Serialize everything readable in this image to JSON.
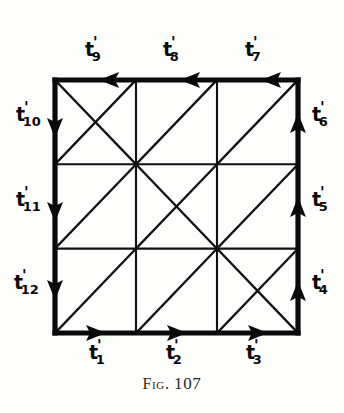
{
  "figure": {
    "caption_prefix": "Fig.",
    "caption_number": "107",
    "caption_full": "FIG. 107",
    "ink_color": "#0a0a0a",
    "background_color": "#fdfdfb"
  },
  "diagram": {
    "type": "truss-grid",
    "grid": {
      "rows": 3,
      "cols": 3
    },
    "frame": {
      "x": 55,
      "y": 80,
      "width": 243,
      "height": 253
    },
    "cell_diagonals": [
      {
        "row": 0,
        "col": 0,
        "main": true,
        "anti": true
      },
      {
        "row": 0,
        "col": 1,
        "main": false,
        "anti": true
      },
      {
        "row": 0,
        "col": 2,
        "main": false,
        "anti": true
      },
      {
        "row": 1,
        "col": 0,
        "main": false,
        "anti": true
      },
      {
        "row": 1,
        "col": 1,
        "main": true,
        "anti": true
      },
      {
        "row": 1,
        "col": 2,
        "main": false,
        "anti": true
      },
      {
        "row": 2,
        "col": 0,
        "main": false,
        "anti": true
      },
      {
        "row": 2,
        "col": 1,
        "main": false,
        "anti": true
      },
      {
        "row": 2,
        "col": 2,
        "main": true,
        "anti": true
      }
    ]
  },
  "members": {
    "bottom": [
      {
        "id": "t1",
        "base": "t",
        "prime": "'",
        "sub": "1",
        "direction": "right"
      },
      {
        "id": "t2",
        "base": "t",
        "prime": "'",
        "sub": "2",
        "direction": "right"
      },
      {
        "id": "t3",
        "base": "t",
        "prime": "'",
        "sub": "3",
        "direction": "right"
      }
    ],
    "right": [
      {
        "id": "t4",
        "base": "t",
        "prime": "'",
        "sub": "4",
        "direction": "up"
      },
      {
        "id": "t5",
        "base": "t",
        "prime": "'",
        "sub": "5",
        "direction": "up"
      },
      {
        "id": "t6",
        "base": "t",
        "prime": "'",
        "sub": "6",
        "direction": "up"
      }
    ],
    "top": [
      {
        "id": "t7",
        "base": "t",
        "prime": "'",
        "sub": "7",
        "direction": "left"
      },
      {
        "id": "t8",
        "base": "t",
        "prime": "'",
        "sub": "8",
        "direction": "left"
      },
      {
        "id": "t9",
        "base": "t",
        "prime": "'",
        "sub": "9",
        "direction": "left"
      }
    ],
    "left": [
      {
        "id": "t10",
        "base": "t",
        "prime": "'",
        "sub": "10",
        "direction": "down"
      },
      {
        "id": "t11",
        "base": "t",
        "prime": "'",
        "sub": "11",
        "direction": "down"
      },
      {
        "id": "t12",
        "base": "t",
        "prime": "'",
        "sub": "12",
        "direction": "down"
      }
    ]
  }
}
